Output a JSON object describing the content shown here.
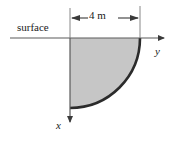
{
  "figure": {
    "background_color": "#ffffff"
  },
  "labels": {
    "surface": "surface",
    "dimension": "4 m",
    "y_axis": "y",
    "x_axis": "x"
  },
  "colors": {
    "fill": "#c6c6c6",
    "arc_stroke": "#2b2b2b",
    "axis_stroke": "#5a5a5a",
    "dim_stroke": "#3a3a3a",
    "text": "#1a1a1a"
  },
  "geometry": {
    "origin_x": 70,
    "origin_y": 38,
    "radius_px": 70,
    "radius_label": "4 m",
    "surface_line_x_start": 10,
    "surface_line_x_end": 168,
    "x_axis_y_end": 126,
    "dimension_line_y": 18,
    "dimension_left_x": 70,
    "dimension_right_x": 140
  },
  "icons": {
    "y_arrow": "arrow-right-icon",
    "x_arrow": "arrow-down-icon",
    "dim_left_arrow": "arrow-left-icon",
    "dim_right_arrow": "arrow-right-icon"
  }
}
